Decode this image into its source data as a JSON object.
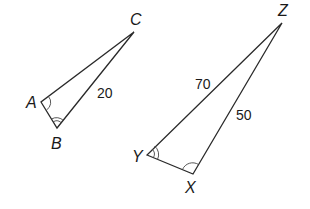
{
  "diagram": {
    "triangles": [
      {
        "name": "ABC",
        "vertices": {
          "A": "A",
          "B": "B",
          "C": "C"
        },
        "sides": {
          "BC": "20"
        },
        "angle_marks": {
          "A": "single arc",
          "B": "double arc"
        }
      },
      {
        "name": "XYZ",
        "vertices": {
          "X": "X",
          "Y": "Y",
          "Z": "Z"
        },
        "sides": {
          "YZ": "70",
          "XZ": "50"
        },
        "angle_marks": {
          "Y": "double arc",
          "X": "single arc"
        }
      }
    ],
    "labels": {
      "A": "A",
      "B": "B",
      "C": "C",
      "X": "X",
      "Y": "Y",
      "Z": "Z",
      "side_BC": "20",
      "side_YZ": "70",
      "side_XZ": "50"
    }
  }
}
